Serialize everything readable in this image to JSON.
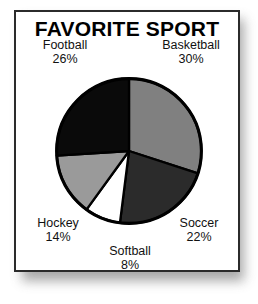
{
  "card": {
    "title": "FAVORITE SPORT",
    "background": "#ffffff",
    "border_color": "#2b2b2b"
  },
  "chart_data": {
    "type": "pie",
    "title": "FAVORITE SPORT",
    "xlabel": "",
    "ylabel": "",
    "legend_position": "outside-labels",
    "grid": false,
    "start_angle_deg": 0,
    "direction": "clockwise",
    "categories": [
      "Basketball",
      "Soccer",
      "Softball",
      "Hockey",
      "Football"
    ],
    "values": [
      30,
      22,
      8,
      14,
      26
    ],
    "unit": "%",
    "total": 100,
    "slices": [
      {
        "label": "Basketball",
        "value": 30,
        "value_text": "30%",
        "color": "#808080",
        "outline": "#000000"
      },
      {
        "label": "Soccer",
        "value": 22,
        "value_text": "22%",
        "color": "#2b2b2b",
        "outline": "#000000"
      },
      {
        "label": "Softball",
        "value": 8,
        "value_text": "8%",
        "color": "#ffffff",
        "outline": "#000000"
      },
      {
        "label": "Hockey",
        "value": 14,
        "value_text": "14%",
        "color": "#9a9a9a",
        "outline": "#000000"
      },
      {
        "label": "Football",
        "value": 26,
        "value_text": "26%",
        "color": "#0a0a0a",
        "outline": "#000000"
      }
    ]
  },
  "labels": {
    "football": {
      "name": "Football",
      "pct": "26%"
    },
    "basketball": {
      "name": "Basketball",
      "pct": "30%"
    },
    "hockey": {
      "name": "Hockey",
      "pct": "14%"
    },
    "soccer": {
      "name": "Soccer",
      "pct": "22%"
    },
    "softball": {
      "name": "Softball",
      "pct": "8%"
    }
  }
}
